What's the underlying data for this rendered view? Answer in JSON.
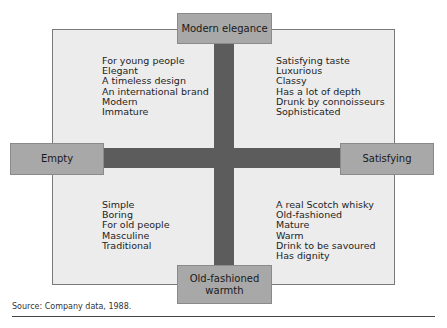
{
  "diagram": {
    "type": "perceptual-map",
    "axes": {
      "vertical": {
        "top": "Modern elegance",
        "bottom": "Old-fashioned\nwarmth"
      },
      "horizontal": {
        "left": "Empty",
        "right": "Satisfying"
      }
    },
    "quadrants": {
      "top_left": [
        "For young people",
        "Elegant",
        "A timeless design",
        "An international brand",
        "Modern",
        "Immature"
      ],
      "top_right": [
        "Satisfying taste",
        "Luxurious",
        "Classy",
        "Has a lot of depth",
        "Drunk by connoisseurs",
        "Sophisticated"
      ],
      "bottom_left": [
        "Simple",
        "Boring",
        "For old people",
        "Masculine",
        "Traditional"
      ],
      "bottom_right": [
        "A real Scotch whisky",
        "Old-fashioned",
        "Mature",
        "Warm",
        "Drink to be savoured",
        "Has dignity"
      ]
    },
    "source": "Source: Company data, 1988.",
    "colors": {
      "frame_fill": "#ececec",
      "axis_bar": "#5c5c5c",
      "pole_box": "#a8a8a8"
    }
  }
}
